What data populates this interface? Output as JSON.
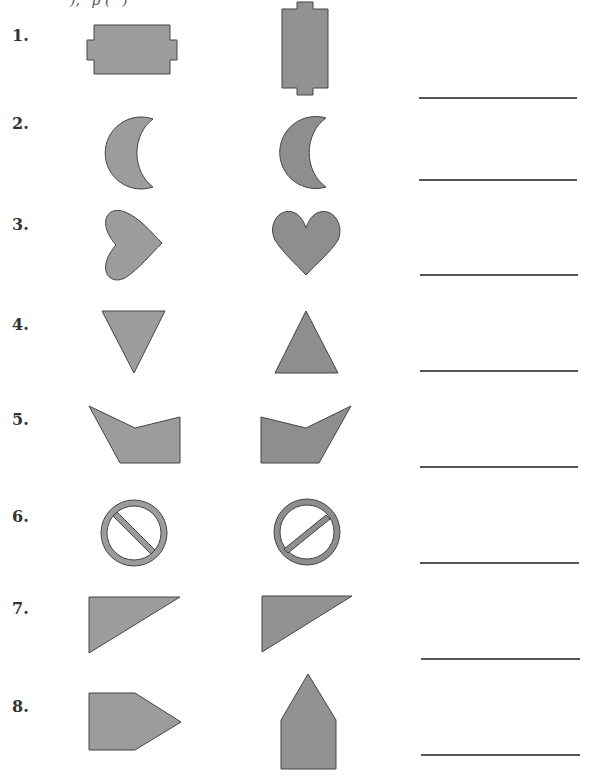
{
  "worksheet": {
    "top_text_fragment": "),    p (      )",
    "colors": {
      "fill": "#9a9a9a",
      "fill_dark": "#8e8e8e",
      "stroke": "#444444",
      "answer_line": "#555555"
    },
    "items": [
      {
        "label": "1.",
        "left_shape": "wide-notched-rectangle",
        "right_shape": "tall-notched-rectangle"
      },
      {
        "label": "2.",
        "left_shape": "crescent",
        "right_shape": "crescent"
      },
      {
        "label": "3.",
        "left_shape": "heart-rotated-right",
        "right_shape": "heart"
      },
      {
        "label": "4.",
        "left_shape": "triangle-down",
        "right_shape": "triangle-up"
      },
      {
        "label": "5.",
        "left_shape": "pentagon-notch",
        "right_shape": "pentagon-notch-mirrored"
      },
      {
        "label": "6.",
        "left_shape": "prohibition-sign-backslash",
        "right_shape": "prohibition-sign-slash"
      },
      {
        "label": "7.",
        "left_shape": "right-triangle",
        "right_shape": "right-triangle"
      },
      {
        "label": "8.",
        "left_shape": "pentagon-arrow-right",
        "right_shape": "pentagon-arrow-up"
      }
    ]
  }
}
